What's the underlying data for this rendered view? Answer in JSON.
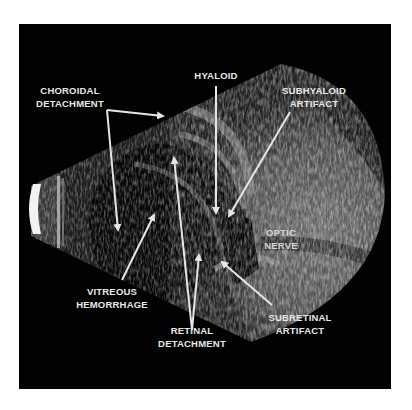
{
  "figure": {
    "background_color": "#020202",
    "label_color": "#e8e8e8",
    "arrow_color": "#e6e6e6"
  },
  "labels": {
    "choroidal": {
      "line1": "CHOROIDAL",
      "line2": "DETACHMENT"
    },
    "hyaloid": {
      "line1": "HYALOID"
    },
    "subhyaloid": {
      "line1": "SUBHYALOID",
      "line2": "ARTIFACT"
    },
    "optic_nerve": {
      "line1": "OPTIC",
      "line2": "NERVE"
    },
    "vitreous": {
      "line1": "VITREOUS",
      "line2": "HEMORRHAGE"
    },
    "retinal": {
      "line1": "RETINAL",
      "line2": "DETACHMENT"
    },
    "subretinal": {
      "line1": "SUBRETINAL",
      "line2": "ARTIFACT"
    }
  }
}
